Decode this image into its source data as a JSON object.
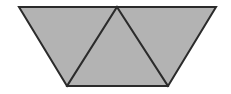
{
  "figure": {
    "name": "trapezoid-with-inscribed-triangle",
    "canvas": {
      "width": 231,
      "height": 94,
      "background_color": "#ffffff"
    },
    "style": {
      "fill_color": "#b3b3b3",
      "stroke_color": "#2b2b2b",
      "stroke_width": 2,
      "stroke_linejoin": "miter"
    },
    "vertices": {
      "top_left": {
        "label": "A",
        "x": 19,
        "y": 7
      },
      "top_apex": {
        "label": "E",
        "x": 117,
        "y": 7
      },
      "top_right": {
        "label": "B",
        "x": 216,
        "y": 7
      },
      "bottom_right": {
        "label": "C",
        "x": 168,
        "y": 86
      },
      "bottom_left": {
        "label": "D",
        "x": 67,
        "y": 86
      }
    },
    "outline_points": "19,7 216,7 168,86 67,86",
    "regions": [
      {
        "name": "left-triangle",
        "points": "19,7 117,7 67,86",
        "fill": "#b3b3b3"
      },
      {
        "name": "center-triangle",
        "points": "117,7 168,86 67,86",
        "fill": "#b3b3b3"
      },
      {
        "name": "right-triangle",
        "points": "117,7 216,7 168,86",
        "fill": "#b3b3b3"
      }
    ],
    "divider_segments": [
      {
        "name": "left-divider",
        "x1": 117,
        "y1": 7,
        "x2": 67,
        "y2": 86
      },
      {
        "name": "right-divider",
        "x1": 117,
        "y1": 7,
        "x2": 168,
        "y2": 86
      }
    ]
  }
}
